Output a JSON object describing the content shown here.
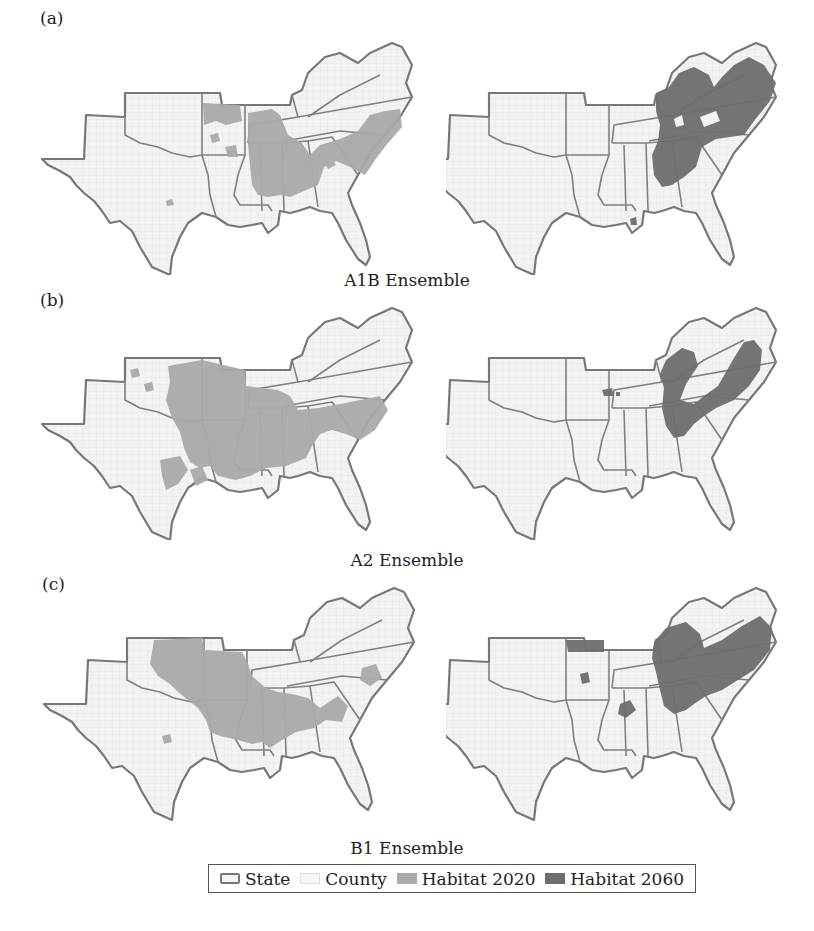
{
  "figure": {
    "panels": [
      {
        "label": "(a)",
        "scenario": "A1B Ensemble",
        "left_map": "Habitat 2020",
        "right_map": "Habitat 2060"
      },
      {
        "label": "(b)",
        "scenario": "A2 Ensemble",
        "left_map": "Habitat 2020",
        "right_map": "Habitat 2060"
      },
      {
        "label": "(c)",
        "scenario": "B1 Ensemble",
        "left_map": "Habitat 2020",
        "right_map": "Habitat 2060"
      }
    ],
    "region": "Southeastern United States (TX, OK, AR, LA, MS, AL, TN, KY, GA, FL, SC, NC, VA)"
  },
  "legend": {
    "items": [
      {
        "label": "State",
        "symbol": "state-outline"
      },
      {
        "label": "County",
        "symbol": "county-fill"
      },
      {
        "label": "Habitat 2020",
        "symbol": "habitat-2020"
      },
      {
        "label": "Habitat 2060",
        "symbol": "habitat-2060"
      }
    ]
  },
  "colors": {
    "background": "#ffffff",
    "county_fill": "#f2f2f2",
    "state_border": "#777777",
    "habitat_2020": "#aaaaaa",
    "habitat_2060": "#6e6e6e"
  }
}
